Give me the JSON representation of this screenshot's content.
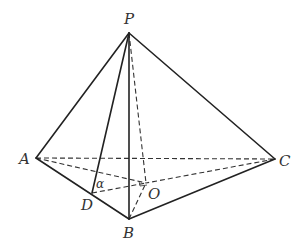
{
  "diagram": {
    "type": "geometry-pyramid",
    "points": {
      "P": {
        "label": "P",
        "x": 129,
        "y": 33
      },
      "A": {
        "label": "A",
        "x": 36,
        "y": 158
      },
      "B": {
        "label": "B",
        "x": 129,
        "y": 219
      },
      "C": {
        "label": "C",
        "x": 275,
        "y": 159
      },
      "D": {
        "label": "D",
        "x": 92,
        "y": 193
      },
      "O": {
        "label": "O",
        "x": 146,
        "y": 183
      }
    },
    "angle_label": "α",
    "solid_edges": [
      "PA",
      "PB",
      "PC",
      "PD",
      "AB",
      "BC"
    ],
    "dashed_edges": [
      "AC",
      "AO",
      "CO",
      "PO",
      "DO",
      "BO"
    ]
  }
}
